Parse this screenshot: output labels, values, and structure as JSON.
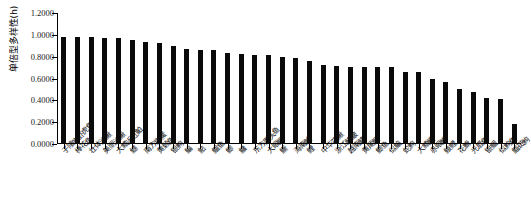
{
  "chart_data": {
    "type": "bar",
    "title": "",
    "xlabel": "",
    "ylabel": "单倍型多样性(h)",
    "ylim": [
      0.0,
      1.2
    ],
    "yticks": [
      "0.0000",
      "0.2000",
      "0.4000",
      "0.6000",
      "0.8000",
      "1.0000",
      "1.2000"
    ],
    "ytick_values": [
      0.0,
      0.2,
      0.4,
      0.6,
      0.8,
      1.0,
      1.2
    ],
    "grid": false,
    "legend": "none",
    "bar_color": "#0a0a0a",
    "categories": [
      "子陵吻虾虎鱼",
      "棒花鱼",
      "壮体沙鳅",
      "美丽沙鳅",
      "大鳍近红鲌",
      "鳡",
      "南方拟䱗",
      "黄颡鱼",
      "银鮈",
      "鳊",
      "鲇",
      "鲴鱼",
      "鲫",
      "鳙",
      "东方墨头鱼",
      "大眼鳜",
      "鳜",
      "海南鲌",
      "鲤",
      "中华花鳅",
      "浙江鳑鲏",
      "越南鲭",
      "黄尾鲴",
      "鲫鱼",
      "似鳊",
      "蛇鮈",
      "大鳍鳠",
      "赤眼鳟",
      "鲮鲤",
      "花䱻",
      "光唇鱼",
      "银鲴",
      "似鮈鱼",
      "鲻斑鮈"
    ],
    "values": [
      0.981,
      0.979,
      0.977,
      0.97,
      0.968,
      0.956,
      0.932,
      0.924,
      0.902,
      0.868,
      0.865,
      0.862,
      0.833,
      0.829,
      0.819,
      0.814,
      0.795,
      0.785,
      0.762,
      0.72,
      0.713,
      0.71,
      0.709,
      0.708,
      0.706,
      0.664,
      0.662,
      0.6,
      0.567,
      0.501,
      0.477,
      0.417,
      0.412,
      0.18
    ]
  }
}
